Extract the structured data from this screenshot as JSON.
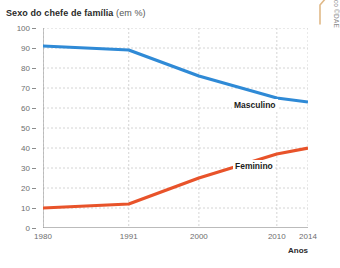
{
  "chart_data": {
    "type": "line",
    "title": "Sexo do chefe de família",
    "title_unit": "(em %)",
    "xlabel": "Anos",
    "ylabel": "",
    "x": [
      1980,
      1991,
      2000,
      2010,
      2014
    ],
    "x_tick_labels": [
      "1980",
      "1991",
      "2000",
      "2010",
      "2014"
    ],
    "y_tick_labels": [
      "100",
      "90",
      "80",
      "70",
      "60",
      "50",
      "40",
      "30",
      "20",
      "10",
      "0"
    ],
    "y_ticks": [
      100,
      90,
      80,
      70,
      60,
      50,
      40,
      30,
      20,
      10,
      0
    ],
    "ylim": [
      0,
      100
    ],
    "xlim": [
      1980,
      2014
    ],
    "grid": true,
    "grid_style": "dashed",
    "legend": "inline-labels",
    "series": [
      {
        "name": "Masculino",
        "color": "#2f8ad6",
        "values": [
          91,
          89,
          76,
          65,
          63
        ]
      },
      {
        "name": "Feminino",
        "color": "#e8532a",
        "values": [
          10,
          12,
          25,
          37,
          40
        ]
      }
    ]
  },
  "credit": {
    "text": "Gráfico ©DAE"
  },
  "colors": {
    "masculino": "#2f8ad6",
    "feminino": "#e8532a",
    "grid": "#c9c9c9",
    "axis": "#8c8c8c",
    "text": "#6e6e6e",
    "flourish": "#e0b988"
  }
}
